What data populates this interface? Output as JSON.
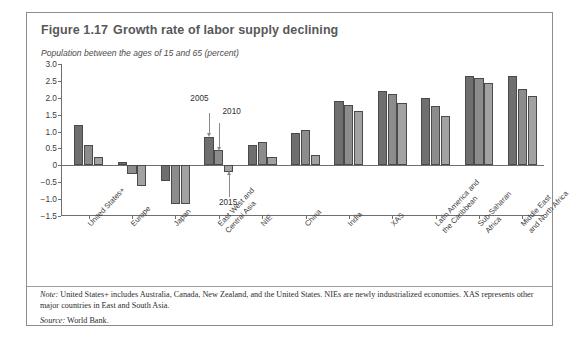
{
  "figure": {
    "number": "Figure 1.17",
    "title": "Growth rate of labor supply declining",
    "axis_caption": "Population between the ages of 15 and 65 (percent)",
    "note_label": "Note:",
    "note_text": " United States+ includes Australia, Canada, New Zealand, and the United States. NIEs are newly industrialized economies. XAS represents other major countries in East and South Asia.",
    "source_label": "Source:",
    "source_text": " World Bank."
  },
  "annotations": [
    {
      "label": "2005"
    },
    {
      "label": "2010"
    },
    {
      "label": "2015"
    }
  ],
  "colors": {
    "series_2005": "#6f6f6f",
    "series_2010": "#8c8c8c",
    "series_2015": "#a2a2a2",
    "frame": "#8d8d8d",
    "axis": "#6f6f6f",
    "title": "#58585a"
  },
  "chart_data": {
    "type": "bar",
    "title": "Growth rate of labor supply declining",
    "xlabel": "",
    "ylabel": "Population between the ages of 15 and 65 (percent)",
    "ylim": [
      -1.5,
      3.0
    ],
    "yticks": [
      "3.0",
      "2.5",
      "2.0",
      "1.5",
      "1.0",
      "0.5",
      "0",
      "−0.5",
      "−1.0",
      "−1.5"
    ],
    "ytick_values": [
      3.0,
      2.5,
      2.0,
      1.5,
      1.0,
      0.5,
      0,
      -0.5,
      -1.0,
      -1.5
    ],
    "grid": false,
    "legend": "annotated-arrows",
    "categories": [
      "United States+",
      "Europe",
      "Japan",
      "East West and Central Asia",
      "NIE",
      "China",
      "India",
      "XAS",
      "Latin America and the Caribbean",
      "Sub-Saharan Africa",
      "Middle East and North Africa"
    ],
    "category_lines": [
      [
        "United States+",
        ""
      ],
      [
        "Europe",
        ""
      ],
      [
        "Japan",
        ""
      ],
      [
        "East West and",
        "Central Asia"
      ],
      [
        "NIE",
        ""
      ],
      [
        "China",
        ""
      ],
      [
        "India",
        ""
      ],
      [
        "XAS",
        ""
      ],
      [
        "Latin America and",
        "the Caribbean"
      ],
      [
        "Sub-Saharan",
        "Africa"
      ],
      [
        "Middle East",
        "and North Africa"
      ]
    ],
    "series": [
      {
        "name": "2005",
        "color": "#6f6f6f",
        "values": [
          1.2,
          0.1,
          -0.45,
          0.85,
          0.6,
          0.95,
          1.9,
          2.2,
          2.0,
          2.65,
          2.65
        ]
      },
      {
        "name": "2010",
        "color": "#8c8c8c",
        "values": [
          0.6,
          -0.25,
          -1.15,
          0.45,
          0.7,
          1.05,
          1.8,
          2.1,
          1.75,
          2.6,
          2.25
        ]
      },
      {
        "name": "2015",
        "color": "#a2a2a2",
        "values": [
          0.25,
          -0.6,
          -1.15,
          -0.2,
          0.25,
          0.3,
          1.6,
          1.85,
          1.45,
          2.45,
          2.05
        ]
      }
    ]
  }
}
